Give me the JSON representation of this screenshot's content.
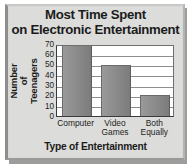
{
  "chart_data": {
    "type": "bar",
    "title": "Most Time Spent\non Electronic Entertainment",
    "title_line1": "Most Time Spent",
    "title_line2": "on Electronic Entertainment",
    "categories": [
      "Computer",
      "Video\nGames",
      "Both\nEqually"
    ],
    "category_plain": [
      "Computer",
      "Video Games",
      "Both Equally"
    ],
    "values": [
      70,
      50,
      20
    ],
    "xlabel": "Type of Entertainment",
    "ylabel": "Number of\nTeenagers",
    "ylabel_line1": "Number of",
    "ylabel_line2": "Teenagers",
    "ylim": [
      0,
      70
    ],
    "yticks": [
      0,
      10,
      20,
      30,
      40,
      50,
      60,
      70
    ],
    "ytick_labels": [
      "0",
      "10",
      "20",
      "30",
      "40",
      "50",
      "60",
      "70"
    ],
    "grid": "horizontal",
    "legend": "none",
    "colors": {
      "bar": "#8c8c8c",
      "bar_edge": "#5e5e5e",
      "plot_background": "#ffffff",
      "figure_background": "#dcdcda",
      "frame": "#8e8e8c",
      "gridline": "#8d8d8d",
      "text": "#1b1b1b"
    }
  }
}
